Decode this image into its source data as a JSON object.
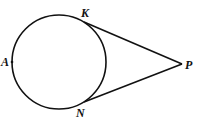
{
  "diagram": {
    "type": "circle-with-two-tangents",
    "circle": {
      "cx": 59,
      "cy": 62,
      "r": 47
    },
    "points": {
      "A": {
        "label": "A",
        "x": 12,
        "y": 62
      },
      "K": {
        "label": "K",
        "x": 84,
        "y": 22
      },
      "N": {
        "label": "N",
        "x": 84,
        "y": 102
      },
      "P": {
        "label": "P",
        "x": 182,
        "y": 64
      }
    },
    "segments": [
      {
        "from": "K",
        "to": "P"
      },
      {
        "from": "N",
        "to": "P"
      }
    ]
  }
}
